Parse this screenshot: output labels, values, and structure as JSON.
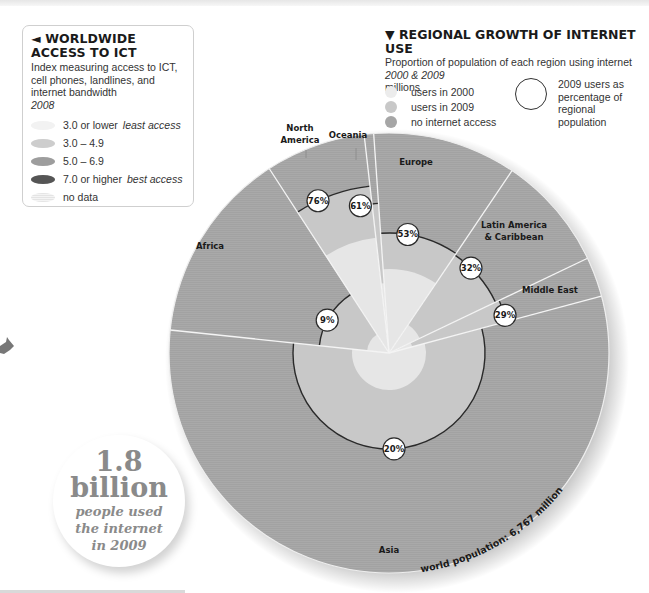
{
  "ict_legend": {
    "title": "◄ WORLDWIDE ACCESS TO ICT",
    "subtitle": "Index measuring access to ICT, cell phones, landlines, and internet bandwidth",
    "year": "2008",
    "items": [
      {
        "label": "3.0 or lower",
        "note": "least access",
        "color": "#f2f2f2"
      },
      {
        "label": "3.0 – 4.9",
        "note": "",
        "color": "#cdcdcd"
      },
      {
        "label": "5.0 – 6.9",
        "note": "",
        "color": "#9d9d9d"
      },
      {
        "label": "7.0 or higher",
        "note": "best access",
        "color": "#555555"
      },
      {
        "label": "no data",
        "note": "",
        "color": "#e4e4e4"
      }
    ]
  },
  "growth_legend": {
    "title": "▼ REGIONAL GROWTH OF INTERNET USE",
    "subtitle": "Proportion of population of each region using internet",
    "years": "2000 & 2009",
    "unit": "millions",
    "items": [
      {
        "label": "users in 2000",
        "color": "#ececec"
      },
      {
        "label": "users in 2009",
        "color": "#c8c8c8"
      },
      {
        "label": "no internet access",
        "color": "#a6a6a6"
      }
    ],
    "ring_label": "2009 users as percentage of regional population"
  },
  "callout": {
    "number": "1.8",
    "unit": "billion",
    "line1": "people used",
    "line2": "the internet",
    "line3": "in 2009"
  },
  "world_population_label": "world population: 6,767 million",
  "chart_data": {
    "type": "pie",
    "title": "REGIONAL GROWTH OF INTERNET USE",
    "subtitle": "Proportion of population of each region using internet, 2000 & 2009 (millions)",
    "total_population_millions": 6767,
    "categories": [
      "Asia",
      "Africa",
      "North America",
      "Oceania",
      "Europe",
      "Latin America & Caribbean",
      "Middle East"
    ],
    "series": [
      {
        "name": "2009 users as % of regional population",
        "values": [
          20,
          9,
          76,
          61,
          53,
          32,
          29
        ]
      }
    ],
    "sectors": [
      {
        "region": "Africa",
        "start": 186,
        "end": 237,
        "r2000": 22,
        "r2009": 70,
        "pct": "9%",
        "label_x": 210,
        "label_y": 249,
        "pct_angle": 208
      },
      {
        "region": "North America",
        "start": 237,
        "end": 263.5,
        "r2000": 116,
        "r2009": 168,
        "pct": "76%",
        "label_x": 300,
        "label_y": 131,
        "pct_angle": 245
      },
      {
        "region": "Oceania",
        "start": 263.5,
        "end": 266,
        "r2000": 70,
        "r2009": 150,
        "pct": "61%",
        "label_x": 348,
        "label_y": 138,
        "pct_angle": 259
      },
      {
        "region": "Europe",
        "start": 266,
        "end": 304,
        "r2000": 84,
        "r2009": 120,
        "pct": "53%",
        "label_x": 416,
        "label_y": 165,
        "pct_angle": 279
      },
      {
        "region": "Latin America & Caribbean",
        "start": 304,
        "end": 334.5,
        "r2000": 34,
        "r2009": 118,
        "pct": "32%",
        "label_x": 514,
        "label_y": 228,
        "pct_angle": 314
      },
      {
        "region": "Middle East",
        "start": 334.5,
        "end": 345,
        "r2000": 24,
        "r2009": 122,
        "pct": "29%",
        "label_x": 550,
        "label_y": 293,
        "pct_angle": 342
      },
      {
        "region": "Asia",
        "start": 345,
        "end": 546,
        "r2000": 37,
        "r2009": 96,
        "pct": "20%",
        "label_x": 389,
        "label_y": 553,
        "pct_angle": 87
      }
    ],
    "outer_radius": 220,
    "center": [
      389,
      353
    ],
    "legend_position": "top"
  }
}
